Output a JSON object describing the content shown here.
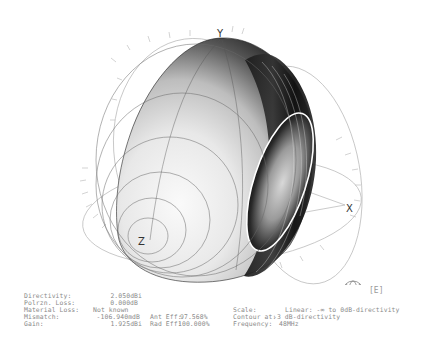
{
  "plot": {
    "type": "3D far-field radiation pattern (torus)",
    "axes": {
      "x_label": "X",
      "y_label": "Y",
      "z_label": "Z"
    },
    "view_indicator": "[E]",
    "colors": {
      "surface_dark": "#111111",
      "surface_light": "#f2f2f2",
      "grid": "#9a9a9a",
      "contour": "#ffffff"
    }
  },
  "results": {
    "directivity_label": "Directivity:",
    "directivity_value": "2.050dBi",
    "polrzn_loss_label": "Polrzn. Loss:",
    "polrzn_loss_value": "0.000dB",
    "material_loss_label": "Material Loss:",
    "material_loss_value": "Not known",
    "mismatch_label": "Mismatch:",
    "mismatch_value": "-106.940mdB",
    "gain_label": "Gain:",
    "gain_value": "1.925dBi",
    "ant_eff_label": "Ant Eff:",
    "ant_eff_value": "97.568%",
    "rad_eff_label": "Rad Eff:",
    "rad_eff_value": "100.000%",
    "scale_label": "Scale:",
    "scale_value": "Linear: -∞ to 0dB-directivity",
    "contour_label": "Contour at:",
    "contour_value": "-3 dB-directivity",
    "frequency_label": "Frequency:",
    "frequency_value": "48MHz"
  }
}
